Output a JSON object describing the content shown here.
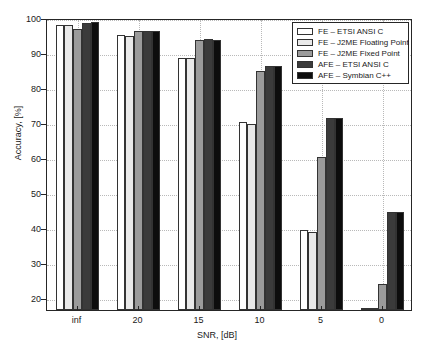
{
  "chart_data": {
    "type": "bar",
    "title": "",
    "xlabel": "SNR, [dB]",
    "ylabel": "Accuracy, [%]",
    "categories": [
      "inf",
      "20",
      "15",
      "10",
      "5",
      "0"
    ],
    "ylim": [
      16.5,
      100
    ],
    "yticks": [
      20,
      30,
      40,
      50,
      60,
      70,
      80,
      90,
      100
    ],
    "ytick_labels": [
      "20",
      "30",
      "40",
      "50",
      "60",
      "70",
      "80",
      "90",
      "100"
    ],
    "grid": true,
    "legend_position": "top-right",
    "series": [
      {
        "name": "FE – ETSI ANSI C",
        "color": "#ffffff",
        "values": [
          98.0,
          95.2,
          88.7,
          70.3,
          39.3,
          17.0
        ]
      },
      {
        "name": "FE – J2ME Floating Point",
        "color": "#e9e9e9",
        "values": [
          98.0,
          95.0,
          88.7,
          69.8,
          38.8,
          17.0
        ]
      },
      {
        "name": "FE – J2ME Fixed Point",
        "color": "#9b9b9b",
        "values": [
          97.0,
          96.4,
          93.7,
          84.8,
          60.3,
          24.0
        ]
      },
      {
        "name": "AFE – ETSI ANSI C",
        "color": "#3b3b3b",
        "values": [
          98.5,
          96.3,
          93.9,
          86.4,
          71.4,
          44.5
        ]
      },
      {
        "name": "AFE – Symbian C++",
        "color": "#0d0d0d",
        "values": [
          98.8,
          96.3,
          93.8,
          86.4,
          71.3,
          44.5
        ]
      }
    ]
  }
}
